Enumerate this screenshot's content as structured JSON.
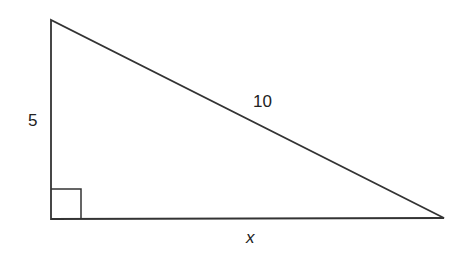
{
  "diagram": {
    "type": "right-triangle",
    "vertices": {
      "top": [
        51,
        20
      ],
      "right_angle": [
        51,
        219
      ],
      "right": [
        444,
        218
      ]
    },
    "right_angle_marker_size": 30,
    "labels": {
      "vertical_leg": "5",
      "hypotenuse": "10",
      "horizontal_leg": "x"
    },
    "stroke_color": "#333333"
  }
}
